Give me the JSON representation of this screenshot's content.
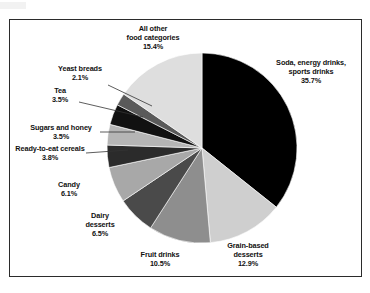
{
  "chart_data": {
    "type": "pie",
    "title": "",
    "subtitle": "",
    "xlabel": "",
    "ylabel": "",
    "legend_position": "labels-outside-with-leader-lines",
    "grid": false,
    "unit": "%",
    "start_angle_deg": 0,
    "direction": "clockwise",
    "categories": [
      "Soda, energy drinks, sports drinks",
      "Grain-based desserts",
      "Fruit drinks",
      "Dairy desserts",
      "Candy",
      "Ready-to-eat cereals",
      "Sugars and honey",
      "Tea",
      "Yeast breads",
      "All other food categories"
    ],
    "values": [
      35.7,
      12.9,
      10.5,
      6.5,
      6.1,
      3.8,
      3.5,
      3.5,
      2.1,
      15.4
    ],
    "slice_colors": [
      "#000000",
      "#cfcfcf",
      "#8e8e8e",
      "#4a4a4a",
      "#a8a8a8",
      "#2b2b2b",
      "#b5b5b5",
      "#111111",
      "#5a5a5a",
      "#dedede"
    ],
    "slices": [
      {
        "label": "Soda, energy drinks, sports drinks",
        "value": 35.7,
        "color": "#000000"
      },
      {
        "label": "Grain-based desserts",
        "value": 12.9,
        "color": "#cfcfcf"
      },
      {
        "label": "Fruit drinks",
        "value": 10.5,
        "color": "#8e8e8e"
      },
      {
        "label": "Dairy desserts",
        "value": 6.5,
        "color": "#4a4a4a"
      },
      {
        "label": "Candy",
        "value": 6.1,
        "color": "#a8a8a8"
      },
      {
        "label": "Ready-to-eat cereals",
        "value": 3.8,
        "color": "#2b2b2b"
      },
      {
        "label": "Sugars and honey",
        "value": 3.5,
        "color": "#b5b5b5"
      },
      {
        "label": "Tea",
        "value": 3.5,
        "color": "#111111"
      },
      {
        "label": "Yeast breads",
        "value": 2.1,
        "color": "#5a5a5a"
      },
      {
        "label": "All other food categories",
        "value": 15.4,
        "color": "#dedede"
      }
    ]
  },
  "labels": {
    "all_other": {
      "line1": "All other",
      "line2": "food categories",
      "pct": "15.4%"
    },
    "soda": {
      "line1": "Soda, energy drinks,",
      "line2": "sports drinks",
      "pct": "35.7%"
    },
    "yeast_breads": {
      "line1": "Yeast breads",
      "pct": "2.1%"
    },
    "tea": {
      "line1": "Tea",
      "pct": "3.5%"
    },
    "sugars_honey": {
      "line1": "Sugars and honey",
      "pct": "3.5%"
    },
    "rte_cereals": {
      "line1": "Ready-to-eat cereals",
      "pct": "3.8%"
    },
    "candy": {
      "line1": "Candy",
      "pct": "6.1%"
    },
    "dairy_desserts": {
      "line1": "Dairy",
      "line2": "desserts",
      "pct": "6.5%"
    },
    "fruit_drinks": {
      "line1": "Fruit drinks",
      "pct": "10.5%"
    },
    "grain_based": {
      "line1": "Grain-based",
      "line2": "desserts",
      "pct": "12.9%"
    }
  }
}
